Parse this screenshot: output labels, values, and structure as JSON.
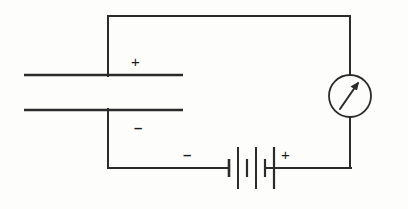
{
  "diagram": {
    "type": "electrical-circuit-schematic",
    "stroke_color": "#2b2b2b",
    "background_color": "#fdfdfc",
    "labels": {
      "capacitor_top_plate_polarity": "+",
      "capacitor_bottom_plate_polarity": "–",
      "battery_negative_terminal": "–",
      "battery_positive_terminal": "+"
    },
    "components": {
      "capacitor": {
        "name": "parallel-plate-capacitor",
        "top_plate": {
          "x1": 24,
          "y1": 75,
          "x2": 183,
          "y2": 75
        },
        "bottom_plate": {
          "x1": 24,
          "y1": 110,
          "x2": 183,
          "y2": 110
        }
      },
      "meter": {
        "name": "ammeter",
        "shape": "circle-with-needle",
        "center_x": 350,
        "center_y": 96,
        "radius": 21,
        "needle_angle_deg": 55
      },
      "battery": {
        "name": "battery-three-cells",
        "cell_count": 3,
        "center_x": 247,
        "baseline_y": 168,
        "short_plate_half_height": 9,
        "long_plate_half_height": 20
      },
      "wires": {
        "top_rail": {
          "x1": 108,
          "y1": 16,
          "x2": 350,
          "y2": 16
        },
        "left_upper_riser": {
          "x1": 108,
          "y1": 16,
          "x2": 108,
          "y2": 75
        },
        "left_lower_riser": {
          "x1": 108,
          "y1": 110,
          "x2": 108,
          "y2": 168
        },
        "right_upper_riser": {
          "x1": 350,
          "y1": 16,
          "x2": 350,
          "y2": 75
        },
        "right_lower_riser": {
          "x1": 350,
          "y1": 117,
          "x2": 350,
          "y2": 168
        },
        "bottom_left_rail": {
          "x1": 108,
          "y1": 168,
          "x2": 228,
          "y2": 168
        },
        "bottom_right_rail": {
          "x1": 266,
          "y1": 168,
          "x2": 350,
          "y2": 168
        }
      }
    }
  }
}
